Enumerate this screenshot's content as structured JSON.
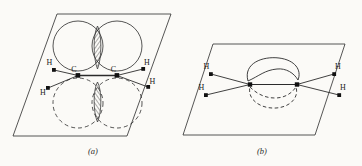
{
  "figure": {
    "background_color": "#fbfaf7",
    "line_color": "#2b2b2b",
    "hatch_color": "#4a4a4a"
  },
  "panels": [
    {
      "id": "a",
      "caption": "(a)",
      "description": "Two p orbitals on each carbon overlapping sideways above and below the molecular plane",
      "atoms": [
        {
          "label": "C",
          "name": "carbon-left"
        },
        {
          "label": "C",
          "name": "carbon-right"
        },
        {
          "label": "H",
          "name": "hydrogen-upper-left"
        },
        {
          "label": "H",
          "name": "hydrogen-lower-left"
        },
        {
          "label": "H",
          "name": "hydrogen-upper-right"
        },
        {
          "label": "H",
          "name": "hydrogen-lower-right"
        }
      ],
      "orbitals": [
        {
          "name": "p-lobe-upper-left",
          "style": "solid"
        },
        {
          "name": "p-lobe-upper-right",
          "style": "solid"
        },
        {
          "name": "p-lobe-lower-left",
          "style": "dashed"
        },
        {
          "name": "p-lobe-lower-right",
          "style": "dashed"
        },
        {
          "name": "overlap-region-upper",
          "style": "hatched"
        },
        {
          "name": "overlap-region-lower",
          "style": "hatched"
        }
      ]
    },
    {
      "id": "b",
      "caption": "(b)",
      "description": "Resulting pi molecular orbital shown as banana shaped lobes above and below the molecular plane",
      "atoms": [
        {
          "label": "H",
          "name": "hydrogen-upper-left"
        },
        {
          "label": "H",
          "name": "hydrogen-lower-left"
        },
        {
          "label": "H",
          "name": "hydrogen-upper-right"
        },
        {
          "label": "H",
          "name": "hydrogen-lower-right"
        }
      ],
      "orbitals": [
        {
          "name": "pi-lobe-upper",
          "style": "solid"
        },
        {
          "name": "pi-lobe-lower",
          "style": "dashed"
        }
      ]
    }
  ],
  "labels": {
    "carbon": "C",
    "hydrogen": "H",
    "caption_a": "(a)",
    "caption_b": "(b)"
  }
}
